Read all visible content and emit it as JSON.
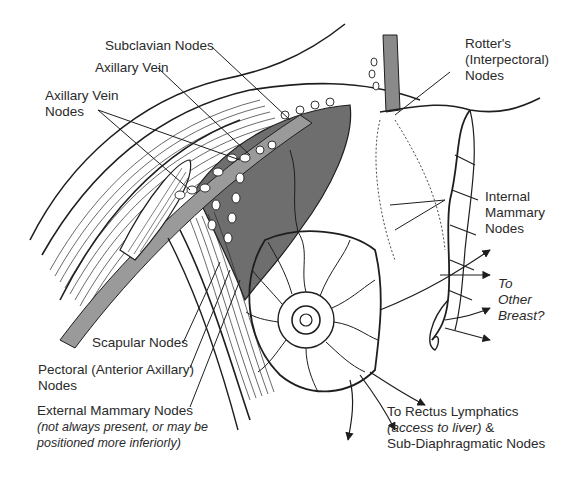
{
  "diagram": {
    "colors": {
      "line": "#1e1e1e",
      "vessel_fill": "#8a8a8a",
      "dark_region": "#6e6e6e",
      "light_fill": "#b8b8b8",
      "background": "#ffffff"
    }
  },
  "labels": {
    "subclavian": {
      "line1": "Subclavian Nodes"
    },
    "axillary_vein": {
      "line1": "Axillary Vein"
    },
    "axillary_vein_nodes": {
      "line1": "Axillary Vein",
      "line2": "Nodes"
    },
    "rotters": {
      "line1": "Rotter's",
      "line2": "(Interpectoral)",
      "line3": "Nodes"
    },
    "internal_mammary": {
      "line1": "Internal",
      "line2": "Mammary",
      "line3": "Nodes"
    },
    "other_breast": {
      "line1": "To",
      "line2": "Other",
      "line3": "Breast?"
    },
    "scapular": {
      "line1": "Scapular Nodes"
    },
    "pectoral": {
      "line1": "Pectoral (Anterior Axillary)",
      "line2": "Nodes"
    },
    "external_mammary": {
      "line1": "External Mammary Nodes",
      "note1": "(not always present, or may be",
      "note2": "positioned more inferiorly)"
    },
    "rectus": {
      "line1": "To Rectus Lymphatics",
      "note": "(access to liver)",
      "line2_suffix": " &",
      "line3": "Sub-Diaphragmatic Nodes"
    }
  }
}
